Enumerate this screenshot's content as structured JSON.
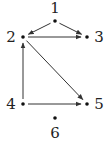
{
  "diagram": {
    "type": "directed-graph",
    "nodes": [
      {
        "id": "1",
        "label": "1",
        "x": 55,
        "y": 21,
        "lx": 55,
        "ly": 13
      },
      {
        "id": "2",
        "label": "2",
        "x": 23,
        "y": 37,
        "lx": 11,
        "ly": 42
      },
      {
        "id": "3",
        "label": "3",
        "x": 87,
        "y": 37,
        "lx": 99,
        "ly": 42
      },
      {
        "id": "4",
        "label": "4",
        "x": 23,
        "y": 104,
        "lx": 11,
        "ly": 109
      },
      {
        "id": "5",
        "label": "5",
        "x": 87,
        "y": 104,
        "lx": 99,
        "ly": 109
      },
      {
        "id": "6",
        "label": "6",
        "x": 55,
        "y": 118,
        "lx": 55,
        "ly": 138
      }
    ],
    "edges": [
      {
        "from": "1",
        "to": "2"
      },
      {
        "from": "1",
        "to": "3"
      },
      {
        "from": "2",
        "to": "3"
      },
      {
        "from": "2",
        "to": "5"
      },
      {
        "from": "4",
        "to": "2"
      },
      {
        "from": "4",
        "to": "5"
      }
    ]
  }
}
